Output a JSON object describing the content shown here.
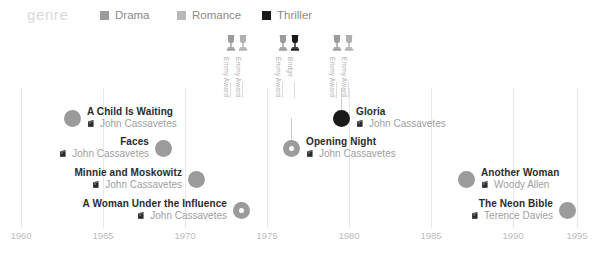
{
  "legend": {
    "title": "genre",
    "items": [
      {
        "label": "Drama",
        "color": "#9b9b9b",
        "x": 100
      },
      {
        "label": "Romance",
        "color": "#b9b9b9",
        "x": 177
      },
      {
        "label": "Thriller",
        "color": "#1a1a1a",
        "x": 262
      }
    ]
  },
  "axis": {
    "label": "",
    "ticks": [
      {
        "year": "1960",
        "x": 21
      },
      {
        "year": "1965",
        "x": 103
      },
      {
        "year": "1970",
        "x": 185
      },
      {
        "year": "1975",
        "x": 267
      },
      {
        "year": "1980",
        "x": 349
      },
      {
        "year": "1985",
        "x": 431
      },
      {
        "year": "1990",
        "x": 513
      },
      {
        "year": "1995",
        "x": 577
      }
    ],
    "range": [
      1960,
      1995
    ],
    "step": 5,
    "gridline_color": "#e8e8e8"
  },
  "awards": [
    {
      "label": "Emmy Award",
      "x": 231,
      "icon": "trophy-icon",
      "color": "#9b9b9b"
    },
    {
      "label": "Emmy Award",
      "x": 243,
      "icon": "trophy-icon",
      "color": "#b0b0b0"
    },
    {
      "label": "Emmy Award",
      "x": 283,
      "icon": "trophy-icon",
      "color": "#9b9b9b"
    },
    {
      "label": "Bridge",
      "x": 295,
      "icon": "trophy-icon",
      "color": "#1a1a1a"
    },
    {
      "label": "Emmy Award",
      "x": 337,
      "icon": "trophy-icon",
      "color": "#9b9b9b"
    },
    {
      "label": "Emmy Award",
      "x": 349,
      "icon": "trophy-icon",
      "color": "#b0b0b0"
    }
  ],
  "films": [
    {
      "title": "A Child Is Waiting",
      "director": "John Cassavetes",
      "genre": "Drama",
      "color": "#9b9b9b",
      "marker": "solid",
      "lead": false,
      "align": "left",
      "x": 64,
      "y": 74
    },
    {
      "title": "Faces",
      "director": "John Cassavetes",
      "genre": "Drama",
      "color": "#9b9b9b",
      "marker": "solid",
      "lead": false,
      "align": "right",
      "x": 172,
      "y": 104
    },
    {
      "title": "Minnie and Moskowitz",
      "director": "Drama",
      "genre": "Drama",
      "color": "#9b9b9b",
      "marker": "solid",
      "lead": false,
      "align": "right",
      "x": 205,
      "y": 135
    },
    {
      "title": "A Woman Under the Influence",
      "director": "John Cassavetes",
      "genre": "Drama",
      "color": "#9b9b9b",
      "marker": "ring",
      "lead": false,
      "align": "right",
      "x": 250,
      "y": 166
    },
    {
      "title": "Opening Night",
      "director": "John Cassavetes",
      "genre": "Drama",
      "color": "#9b9b9b",
      "marker": "ring",
      "lead": true,
      "align": "left",
      "x": 283,
      "y": 104
    },
    {
      "title": "Gloria",
      "director": "John Cassavetes",
      "genre": "Thriller",
      "color": "#1a1a1a",
      "marker": "solid",
      "lead": true,
      "align": "left",
      "x": 333,
      "y": 74
    },
    {
      "title": "Another Woman",
      "director": "Woody Allen",
      "genre": "Drama",
      "color": "#9b9b9b",
      "marker": "solid",
      "lead": false,
      "align": "left",
      "x": 458,
      "y": 135
    },
    {
      "title": "The Neon Bible",
      "director": "Terence Davies",
      "genre": "Drama",
      "color": "#9b9b9b",
      "marker": "solid",
      "lead": false,
      "align": "right",
      "x": 576,
      "y": 166
    }
  ],
  "films_director_fix": {
    "2": "John Cassavetes"
  },
  "chart_data": {
    "type": "scatter",
    "title": "genre",
    "xlabel": "",
    "ylabel": "",
    "xlim": [
      1960,
      1995
    ],
    "grid": true,
    "legend_position": "top",
    "categories": [
      "Drama",
      "Romance",
      "Thriller"
    ],
    "series": [
      {
        "name": "Drama",
        "color": "#9b9b9b",
        "points": [
          {
            "label": "A Child Is Waiting",
            "director": "John Cassavetes",
            "year": 1963
          },
          {
            "label": "Faces",
            "director": "John Cassavetes",
            "year": 1968
          },
          {
            "label": "Minnie and Moskowitz",
            "director": "John Cassavetes",
            "year": 1971
          },
          {
            "label": "A Woman Under the Influence",
            "director": "John Cassavetes",
            "year": 1974
          },
          {
            "label": "Opening Night",
            "director": "John Cassavetes",
            "year": 1977
          },
          {
            "label": "Another Woman",
            "director": "Woody Allen",
            "year": 1988
          },
          {
            "label": "The Neon Bible",
            "director": "Terence Davies",
            "year": 1995
          }
        ]
      },
      {
        "name": "Romance",
        "color": "#b9b9b9",
        "points": []
      },
      {
        "name": "Thriller",
        "color": "#1a1a1a",
        "points": [
          {
            "label": "Gloria",
            "director": "John Cassavetes",
            "year": 1980
          }
        ]
      }
    ],
    "annotations": [
      {
        "text": "Emmy Award",
        "year": 1974
      },
      {
        "text": "Emmy Award",
        "year": 1974
      },
      {
        "text": "Emmy Award",
        "year": 1977
      },
      {
        "text": "Bridge",
        "year": 1977
      },
      {
        "text": "Emmy Award",
        "year": 1980
      },
      {
        "text": "Emmy Award",
        "year": 1980
      }
    ]
  }
}
